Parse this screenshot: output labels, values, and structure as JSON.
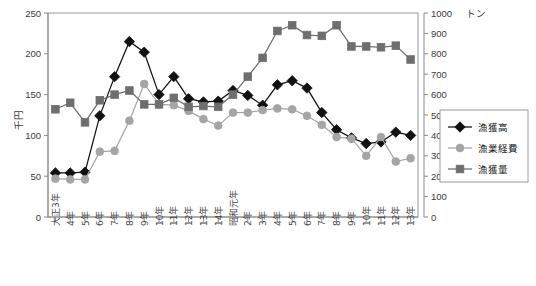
{
  "chart_data": {
    "type": "line",
    "title": "",
    "subtitle": "",
    "xlabel": "",
    "ylabel": "千円",
    "y2label": "トン",
    "ylim": [
      0,
      250
    ],
    "y2lim": [
      0,
      1000
    ],
    "yticks": [
      0,
      50,
      100,
      150,
      200,
      250
    ],
    "y2ticks": [
      0,
      100,
      200,
      300,
      400,
      500,
      600,
      700,
      800,
      900,
      1000
    ],
    "grid": false,
    "legend_position": "right-middle",
    "categories": [
      "大正3年",
      "4年",
      "5年",
      "6年",
      "7年",
      "8年",
      "9年",
      "10年",
      "11年",
      "12年",
      "13年",
      "14年",
      "昭和元年",
      "2年",
      "3年",
      "4年",
      "5年",
      "6年",
      "7年",
      "8年",
      "9年",
      "10年",
      "11年",
      "12年",
      "13年"
    ],
    "series": [
      {
        "name": "漁獲高",
        "axis": "left",
        "unit": "千円",
        "marker": "diamond",
        "color": "#111111",
        "values": [
          54,
          54,
          55,
          124,
          172,
          215,
          202,
          150,
          172,
          145,
          141,
          142,
          155,
          149,
          137,
          162,
          167,
          158,
          128,
          107,
          97,
          90,
          92,
          104,
          100
        ]
      },
      {
        "name": "漁業経費",
        "axis": "left",
        "unit": "千円",
        "marker": "circle",
        "color": "#a5a5a5",
        "values": [
          47,
          46,
          46,
          80,
          81,
          118,
          163,
          138,
          137,
          130,
          120,
          112,
          128,
          128,
          131,
          133,
          132,
          124,
          113,
          98,
          96,
          75,
          98,
          68,
          72
        ]
      },
      {
        "name": "漁獲量",
        "axis": "right",
        "unit": "トン",
        "marker": "square",
        "color": "#6e6e6e",
        "values": [
          528,
          560,
          464,
          572,
          600,
          620,
          552,
          552,
          584,
          540,
          544,
          540,
          600,
          688,
          780,
          912,
          940,
          892,
          888,
          940,
          836,
          836,
          832,
          840,
          772
        ]
      }
    ],
    "annotations": []
  },
  "legend": {
    "items": [
      {
        "label": "漁獲高",
        "marker": "diamond",
        "color": "#111111"
      },
      {
        "label": "漁業経費",
        "marker": "circle",
        "color": "#a5a5a5"
      },
      {
        "label": "漁獲量",
        "marker": "square",
        "color": "#6e6e6e"
      }
    ]
  }
}
